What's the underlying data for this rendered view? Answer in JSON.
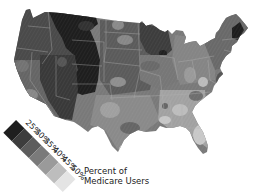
{
  "map": {
    "title": "Percent of Medicare Users",
    "region": "Contiguous United States",
    "style": "grayscale choropleth"
  },
  "legend": {
    "title_line1": "Percent of",
    "title_line2": "Medicare Users",
    "labels": [
      "25%",
      "30%",
      "35%",
      "40%",
      "45%",
      "50%"
    ],
    "swatch_colors": [
      "#1f1f1f",
      "#3d3d3d",
      "#5c5c5c",
      "#7a7a7a",
      "#9a9a9a",
      "#bdbdbd",
      "#e4e4e4"
    ]
  },
  "colors": {
    "background": "#ffffff",
    "darkest": "#1f1f1f",
    "dark": "#3a3a3a",
    "mid_dark": "#555555",
    "mid": "#777777",
    "mid_light": "#999999",
    "light": "#b8b8b8",
    "lightest": "#dcdcdc",
    "state_border": "#a8a8a8"
  }
}
